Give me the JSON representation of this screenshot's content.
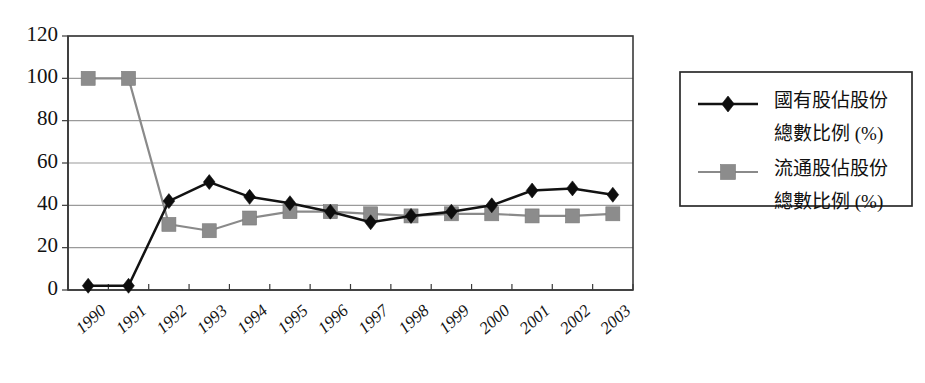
{
  "chart_data": {
    "type": "line",
    "title": "",
    "xlabel": "",
    "ylabel": "",
    "ylim": [
      0,
      120
    ],
    "ytick_step": 20,
    "grid": true,
    "legend_position": "right",
    "categories": [
      "1990",
      "1991",
      "1992",
      "1993",
      "1994",
      "1995",
      "1996",
      "1997",
      "1998",
      "1999",
      "2000",
      "2001",
      "2002",
      "2003"
    ],
    "ytick_labels": [
      "0",
      "20",
      "40",
      "60",
      "80",
      "100",
      "120"
    ],
    "series": [
      {
        "name": "國有股佔股份總數比例 (%)",
        "name_line1": "國有股佔股份",
        "name_line2": "總數比例 (%)",
        "marker": "diamond",
        "color": "#0d0d0d",
        "values": [
          2,
          2,
          42,
          51,
          44,
          41,
          37,
          32,
          35,
          37,
          40,
          47,
          48,
          45
        ]
      },
      {
        "name": "流通股佔股份總數比例 (%)",
        "name_line1": "流通股佔股份",
        "name_line2": "總數比例 (%)",
        "marker": "square",
        "color": "#8c8c8c",
        "values": [
          100,
          100,
          31,
          28,
          34,
          37,
          37,
          36,
          35,
          36,
          36,
          35,
          35,
          36
        ]
      }
    ]
  },
  "legend": {
    "entries": [
      {
        "label_line1": "國有股佔股份",
        "label_line2": "總數比例 (%)"
      },
      {
        "label_line1": "流通股佔股份",
        "label_line2": "總數比例 (%)"
      }
    ]
  }
}
